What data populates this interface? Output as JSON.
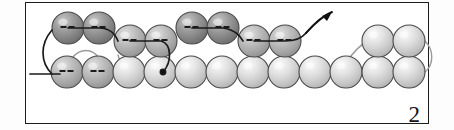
{
  "figure": {
    "step_label": "2",
    "frame_border_color": "#1c1c1c",
    "background_color": "#ffffff",
    "thread_color": "#1a1a1a",
    "old_thread_color": "#9a9a9a",
    "arrow_color": "#111111"
  },
  "legend": {
    "dark_bead_color": "#8f8f8f",
    "light_bead_color": "#d8d8d8",
    "bead_outline_color": "#4a4a4a",
    "dash_mark_color": "#1b1b1b"
  },
  "beads": {
    "bottom_row": [
      {
        "id": "b1",
        "cx": 67,
        "cy": 72,
        "r": 16,
        "shade": "mid",
        "dashes": true
      },
      {
        "id": "b2",
        "cx": 98,
        "cy": 72,
        "r": 16,
        "shade": "mid",
        "dashes": true
      },
      {
        "id": "b3",
        "cx": 129,
        "cy": 72,
        "r": 16,
        "shade": "light",
        "dashes": false
      },
      {
        "id": "b4",
        "cx": 160,
        "cy": 72,
        "r": 16,
        "shade": "light",
        "dashes": false
      },
      {
        "id": "b5",
        "cx": 191,
        "cy": 72,
        "r": 16,
        "shade": "light",
        "dashes": false
      },
      {
        "id": "b6",
        "cx": 222,
        "cy": 72,
        "r": 16,
        "shade": "light",
        "dashes": false
      },
      {
        "id": "b7",
        "cx": 253,
        "cy": 72,
        "r": 16,
        "shade": "light",
        "dashes": false
      },
      {
        "id": "b8",
        "cx": 284,
        "cy": 72,
        "r": 16,
        "shade": "light",
        "dashes": false
      },
      {
        "id": "b9",
        "cx": 315,
        "cy": 72,
        "r": 16,
        "shade": "light",
        "dashes": false
      },
      {
        "id": "b10",
        "cx": 346,
        "cy": 72,
        "r": 16,
        "shade": "light",
        "dashes": false
      },
      {
        "id": "b11",
        "cx": 378,
        "cy": 72,
        "r": 16,
        "shade": "light",
        "dashes": false
      },
      {
        "id": "b12",
        "cx": 409,
        "cy": 72,
        "r": 16,
        "shade": "light",
        "dashes": false
      }
    ],
    "top_row": [
      {
        "id": "t1",
        "cx": 68,
        "cy": 28,
        "r": 16,
        "shade": "dark",
        "dashes": true
      },
      {
        "id": "t2",
        "cx": 99,
        "cy": 28,
        "r": 16,
        "shade": "dark",
        "dashes": true
      },
      {
        "id": "t3",
        "cx": 130,
        "cy": 41,
        "r": 16,
        "shade": "mid",
        "dashes": true
      },
      {
        "id": "t4",
        "cx": 161,
        "cy": 41,
        "r": 16,
        "shade": "mid",
        "dashes": true
      },
      {
        "id": "t5",
        "cx": 192,
        "cy": 28,
        "r": 16,
        "shade": "dark",
        "dashes": true
      },
      {
        "id": "t6",
        "cx": 223,
        "cy": 28,
        "r": 16,
        "shade": "dark",
        "dashes": true
      },
      {
        "id": "t7",
        "cx": 254,
        "cy": 41,
        "r": 16,
        "shade": "mid",
        "dashes": true
      },
      {
        "id": "t8",
        "cx": 285,
        "cy": 41,
        "r": 16,
        "shade": "mid",
        "dashes": true
      },
      {
        "id": "t9",
        "cx": 378,
        "cy": 41,
        "r": 16,
        "shade": "light",
        "dashes": false
      },
      {
        "id": "t10",
        "cx": 409,
        "cy": 41,
        "r": 16,
        "shade": "light",
        "dashes": false
      }
    ]
  },
  "threads": {
    "tail": "M 30 74 L 60 74",
    "new_path": "M 52 30 C 40 44 40 62 52 74",
    "loop_left": "M 68 28 L 99 28 C 112 28 116 36 118 41",
    "loop_mid": "M 130 41 L 161 41 C 172 44 172 62 163 72",
    "loop_right": "M 192 28 L 223 28 C 236 30 240 36 243 41",
    "exit": "M 254 41 L 285 41 C 296 41 302 38 306 33",
    "old_loop_a": "M 99 58 C 92 48 80 48 72 58",
    "old_loop_b": "M 118 55 C 120 64 124 68 129 72",
    "old_loop_c": "M 254 56 C 252 64 250 68 246 72",
    "old_loop_d": "M 285 56 C 288 64 292 68 297 72",
    "old_loop_e": "M 346 64 C 352 52 362 44 368 41",
    "old_loop_f": "M 425 41 C 434 50 434 64 425 72"
  },
  "arrow": {
    "path": "M 306 33 C 314 24 322 16 332 12",
    "head_points": "332,12 322,16 327,21",
    "direction": "up-right"
  }
}
